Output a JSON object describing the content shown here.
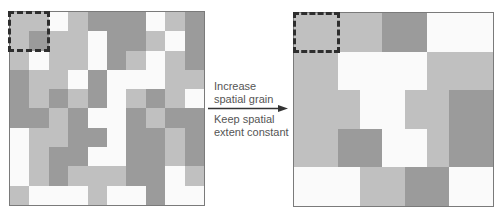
{
  "figure": {
    "type": "spatial-grain-diagram",
    "colors": {
      "W": "#fafafa",
      "L": "#c0c0c0",
      "D": "#9b9b9b",
      "border": "#7a7a7a",
      "dash": "#2e2e2e",
      "text": "#555555",
      "arrow": "#333333"
    },
    "left_panel": {
      "name": "fine-grain-landscape",
      "rows": 10,
      "cols": 10,
      "cells": [
        [
          "L",
          "L",
          "W",
          "L",
          "D",
          "D",
          "D",
          "W",
          "L",
          "D"
        ],
        [
          "L",
          "D",
          "L",
          "L",
          "W",
          "D",
          "D",
          "L",
          "W",
          "D"
        ],
        [
          "L",
          "W",
          "L",
          "L",
          "W",
          "D",
          "L",
          "W",
          "L",
          "D"
        ],
        [
          "D",
          "L",
          "L",
          "W",
          "D",
          "W",
          "W",
          "W",
          "L",
          "L"
        ],
        [
          "D",
          "L",
          "D",
          "L",
          "D",
          "W",
          "L",
          "D",
          "L",
          "W"
        ],
        [
          "D",
          "D",
          "L",
          "D",
          "W",
          "W",
          "D",
          "L",
          "D",
          "D"
        ],
        [
          "W",
          "L",
          "L",
          "D",
          "D",
          "W",
          "D",
          "D",
          "L",
          "D"
        ],
        [
          "W",
          "L",
          "D",
          "D",
          "W",
          "W",
          "D",
          "D",
          "L",
          "D"
        ],
        [
          "W",
          "L",
          "D",
          "L",
          "L",
          "L",
          "D",
          "D",
          "W",
          "L"
        ],
        [
          "L",
          "W",
          "W",
          "W",
          "L",
          "W",
          "W",
          "D",
          "W",
          "W"
        ]
      ]
    },
    "right_panel": {
      "name": "coarse-grain-landscape",
      "unit_cols": 9,
      "rows": 5,
      "row_segments": [
        [
          {
            "span": 2,
            "tone": "L"
          },
          {
            "span": 2,
            "tone": "L"
          },
          {
            "span": 2,
            "tone": "D"
          },
          {
            "span": 3,
            "tone": "W"
          }
        ],
        [
          {
            "span": 2,
            "tone": "L"
          },
          {
            "span": 4,
            "tone": "W"
          },
          {
            "span": 3,
            "tone": "L"
          }
        ],
        [
          {
            "span": 3,
            "tone": "L"
          },
          {
            "span": 2,
            "tone": "W"
          },
          {
            "span": 2,
            "tone": "L"
          },
          {
            "span": 2,
            "tone": "D"
          }
        ],
        [
          {
            "span": 2,
            "tone": "L"
          },
          {
            "span": 2,
            "tone": "D"
          },
          {
            "span": 2,
            "tone": "W"
          },
          {
            "span": 1,
            "tone": "L"
          },
          {
            "span": 2,
            "tone": "D"
          }
        ],
        [
          {
            "span": 3,
            "tone": "W"
          },
          {
            "span": 2,
            "tone": "L"
          },
          {
            "span": 2,
            "tone": "D"
          },
          {
            "span": 2,
            "tone": "W"
          }
        ]
      ]
    },
    "annotation": {
      "top_line1": "Increase",
      "top_line2": "spatial grain",
      "bottom_line1": "Keep spatial",
      "bottom_line2": "extent constant",
      "arrow_direction": "right"
    }
  }
}
